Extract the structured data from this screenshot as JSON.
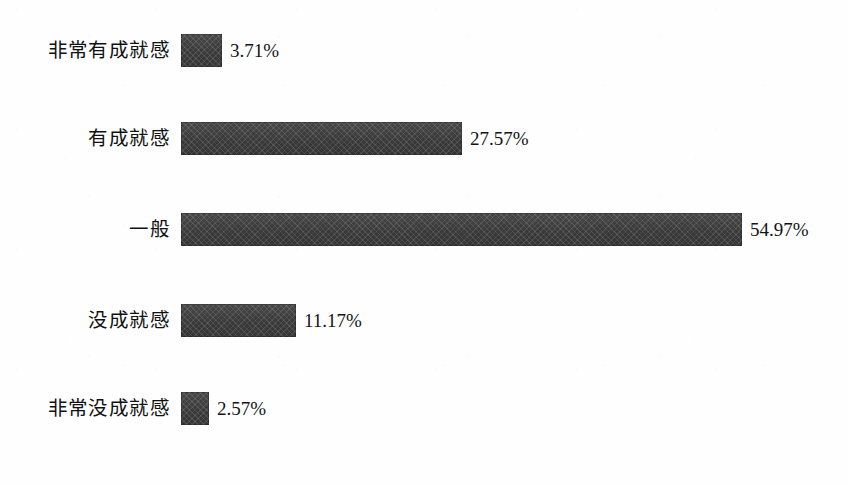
{
  "chart_data": {
    "type": "bar",
    "orientation": "horizontal",
    "title": "",
    "subtitle": "",
    "xlabel": "",
    "ylabel": "",
    "grid": false,
    "legend": null,
    "axis_visible": false,
    "value_suffix": "%",
    "xlim": [
      0,
      54.97
    ],
    "px_per_unit": 10.2,
    "bar_color": "#3c3c3c",
    "background_color": "#fefefe",
    "text_color": "#111111",
    "categories": [
      "非常有成就感",
      "有成就感",
      "一般",
      "没成就感",
      "非常没成就感"
    ],
    "values": [
      3.71,
      27.57,
      54.97,
      11.17,
      2.57
    ],
    "bars": [
      {
        "label": "非常有成就感",
        "value": 3.71,
        "value_label": "3.71%",
        "bar_px": 41,
        "top_px": 34
      },
      {
        "label": "有成就感",
        "value": 27.57,
        "value_label": "27.57%",
        "bar_px": 281,
        "top_px": 122
      },
      {
        "label": "一般",
        "value": 54.97,
        "value_label": "54.97%",
        "bar_px": 561,
        "top_px": 213
      },
      {
        "label": "没成就感",
        "value": 11.17,
        "value_label": "11.17%",
        "bar_px": 115,
        "top_px": 304
      },
      {
        "label": "非常没成就感",
        "value": 2.57,
        "value_label": "2.57%",
        "bar_px": 28,
        "top_px": 392
      }
    ]
  }
}
